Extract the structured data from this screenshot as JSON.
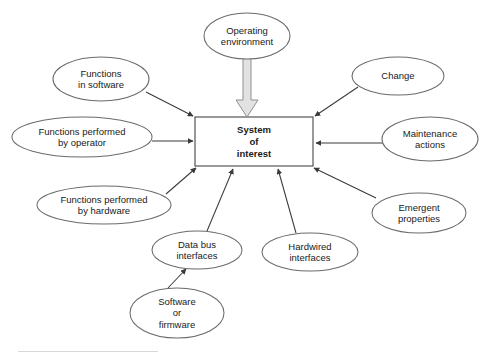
{
  "diagram": {
    "center": {
      "id": "system-of-interest",
      "label": "System\nof\ninterest",
      "shape": "rectangle",
      "x": 195,
      "y": 117,
      "width": 118,
      "height": 49,
      "stroke": "#555555",
      "fill": "#ffffff"
    },
    "nodes": [
      {
        "id": "operating-environment",
        "label": "Operating\nenvironment",
        "shape": "ellipse",
        "cx": 247,
        "cy": 36,
        "rx": 43,
        "ry": 23
      },
      {
        "id": "functions-in-software",
        "label": "Functions\nin software",
        "shape": "ellipse",
        "cx": 101,
        "cy": 79,
        "rx": 48,
        "ry": 22
      },
      {
        "id": "functions-performed-by-operator",
        "label": "Functions performed\nby operator",
        "shape": "ellipse",
        "cx": 82,
        "cy": 137,
        "rx": 70,
        "ry": 20
      },
      {
        "id": "functions-performed-by-hardware",
        "label": "Functions performed\nby hardware",
        "shape": "ellipse",
        "cx": 104,
        "cy": 205,
        "rx": 67,
        "ry": 19
      },
      {
        "id": "data-bus-interfaces",
        "label": "Data bus\ninterfaces",
        "shape": "ellipse",
        "cx": 197,
        "cy": 250,
        "rx": 45,
        "ry": 19
      },
      {
        "id": "software-or-firmware",
        "label": "Software\nor\nfirmware",
        "shape": "ellipse",
        "cx": 177,
        "cy": 313,
        "rx": 47,
        "ry": 25
      },
      {
        "id": "hardwired-interfaces",
        "label": "Hardwired\ninterfaces",
        "shape": "ellipse",
        "cx": 310,
        "cy": 252,
        "rx": 48,
        "ry": 19
      },
      {
        "id": "change",
        "label": "Change",
        "shape": "ellipse",
        "cx": 398,
        "cy": 76,
        "rx": 46,
        "ry": 19
      },
      {
        "id": "maintenance-actions",
        "label": "Maintenance\nactions",
        "shape": "ellipse",
        "cx": 430,
        "cy": 139,
        "rx": 48,
        "ry": 22
      },
      {
        "id": "emergent-properties",
        "label": "Emergent\nproperties",
        "shape": "ellipse",
        "cx": 419,
        "cy": 213,
        "rx": 47,
        "ry": 20
      }
    ],
    "connectors": [
      {
        "id": "block-arrow-operating-environment",
        "from": "operating-environment",
        "to": "system-of-interest",
        "style": "block-arrow",
        "fill": "#e0e0e0",
        "stroke": "#8c8c8c"
      },
      {
        "id": "arrow-functions-in-software",
        "from": "functions-in-software",
        "to": "system-of-interest",
        "style": "line-arrow"
      },
      {
        "id": "arrow-functions-performed-by-operator",
        "from": "functions-performed-by-operator",
        "to": "system-of-interest",
        "style": "line-arrow"
      },
      {
        "id": "arrow-functions-performed-by-hardware",
        "from": "functions-performed-by-hardware",
        "to": "system-of-interest",
        "style": "line-arrow"
      },
      {
        "id": "arrow-data-bus-interfaces",
        "from": "data-bus-interfaces",
        "to": "system-of-interest",
        "style": "line-arrow"
      },
      {
        "id": "arrow-software-or-firmware",
        "from": "software-or-firmware",
        "to": "data-bus-interfaces",
        "style": "line-arrow"
      },
      {
        "id": "arrow-hardwired-interfaces",
        "from": "hardwired-interfaces",
        "to": "system-of-interest",
        "style": "line-arrow"
      },
      {
        "id": "arrow-change",
        "from": "change",
        "to": "system-of-interest",
        "style": "line-arrow"
      },
      {
        "id": "arrow-maintenance-actions",
        "from": "maintenance-actions",
        "to": "system-of-interest",
        "style": "line-arrow"
      },
      {
        "id": "arrow-emergent-properties",
        "from": "emergent-properties",
        "to": "system-of-interest",
        "style": "line-arrow"
      }
    ],
    "colors": {
      "stroke": "#4d4d4d",
      "ellipse_stroke": "#6b6b6b",
      "text": "#1a1a1a",
      "background": "#ffffff",
      "block_arrow_fill": "#e2e2e2"
    }
  }
}
